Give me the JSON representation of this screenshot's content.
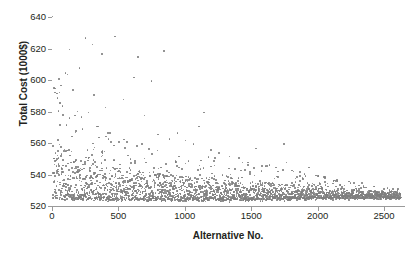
{
  "chart_data": {
    "type": "scatter",
    "title": "",
    "xlabel": "Alternative No.",
    "ylabel": "Total Cost (1000$)",
    "xlim": [
      0,
      2650
    ],
    "ylim": [
      520,
      640
    ],
    "xticks": [
      0,
      500,
      1000,
      1500,
      2000,
      2500
    ],
    "ytickS_note": "",
    "yticks": [
      520,
      540,
      560,
      580,
      600,
      620,
      640
    ],
    "grid": false,
    "legend": null,
    "point_color": "#7f7f7f",
    "point_size_px": 1.6,
    "n_points": 2600,
    "series": [
      {
        "name": "Alternatives",
        "color": "#7f7f7f",
        "envelope": {
          "x": [
            0,
            100,
            250,
            500,
            750,
            1000,
            1250,
            1500,
            1750,
            2000,
            2250,
            2500,
            2620
          ],
          "lower": [
            525.5,
            525.0,
            524.8,
            524.6,
            524.5,
            524.4,
            524.3,
            524.6,
            525.0,
            525.4,
            525.6,
            525.8,
            525.9
          ],
          "upper": [
            600.0,
            588.0,
            576.0,
            566.0,
            560.0,
            556.0,
            551.0,
            548.0,
            545.0,
            540.0,
            536.0,
            533.0,
            531.0
          ],
          "core_upper": [
            562.0,
            556.0,
            549.0,
            544.0,
            541.0,
            539.0,
            537.0,
            535.5,
            534.0,
            532.0,
            530.5,
            529.5,
            529.0
          ]
        },
        "outliers": [
          {
            "x": 18,
            "y": 595
          },
          {
            "x": 30,
            "y": 592
          },
          {
            "x": 36,
            "y": 589
          },
          {
            "x": 48,
            "y": 601
          },
          {
            "x": 60,
            "y": 597
          },
          {
            "x": 72,
            "y": 584
          },
          {
            "x": 96,
            "y": 605
          },
          {
            "x": 110,
            "y": 604
          },
          {
            "x": 126,
            "y": 620
          },
          {
            "x": 150,
            "y": 594
          },
          {
            "x": 168,
            "y": 578
          },
          {
            "x": 200,
            "y": 608
          },
          {
            "x": 215,
            "y": 577
          },
          {
            "x": 246,
            "y": 627
          },
          {
            "x": 270,
            "y": 580
          },
          {
            "x": 300,
            "y": 623
          },
          {
            "x": 312,
            "y": 591
          },
          {
            "x": 340,
            "y": 571
          },
          {
            "x": 372,
            "y": 617
          },
          {
            "x": 396,
            "y": 583
          },
          {
            "x": 430,
            "y": 567
          },
          {
            "x": 470,
            "y": 628
          },
          {
            "x": 500,
            "y": 561
          },
          {
            "x": 532,
            "y": 588
          },
          {
            "x": 560,
            "y": 561
          },
          {
            "x": 610,
            "y": 602
          },
          {
            "x": 640,
            "y": 615
          },
          {
            "x": 690,
            "y": 578
          },
          {
            "x": 742,
            "y": 600
          },
          {
            "x": 790,
            "y": 566
          },
          {
            "x": 836,
            "y": 619
          },
          {
            "x": 880,
            "y": 563
          },
          {
            "x": 940,
            "y": 567
          },
          {
            "x": 1000,
            "y": 562
          },
          {
            "x": 1060,
            "y": 560
          },
          {
            "x": 1100,
            "y": 571
          },
          {
            "x": 1140,
            "y": 580
          },
          {
            "x": 1190,
            "y": 556
          },
          {
            "x": 1250,
            "y": 554
          },
          {
            "x": 1330,
            "y": 552
          },
          {
            "x": 1400,
            "y": 551
          },
          {
            "x": 1470,
            "y": 548
          },
          {
            "x": 1530,
            "y": 557
          },
          {
            "x": 1600,
            "y": 546
          },
          {
            "x": 1680,
            "y": 545
          },
          {
            "x": 1740,
            "y": 560
          },
          {
            "x": 1760,
            "y": 548
          },
          {
            "x": 1800,
            "y": 543
          },
          {
            "x": 1860,
            "y": 542
          },
          {
            "x": 1930,
            "y": 545
          },
          {
            "x": 1980,
            "y": 540
          },
          {
            "x": 2050,
            "y": 539
          },
          {
            "x": 2140,
            "y": 537
          },
          {
            "x": 2230,
            "y": 536
          },
          {
            "x": 2330,
            "y": 535
          },
          {
            "x": 2420,
            "y": 533
          },
          {
            "x": 2520,
            "y": 532
          }
        ]
      }
    ]
  }
}
